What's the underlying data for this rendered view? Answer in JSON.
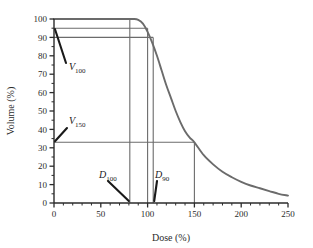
{
  "chart_data": {
    "type": "line",
    "title": "",
    "xlabel": "Dose (%)",
    "ylabel": "Volume (%)",
    "xlim": [
      0,
      250
    ],
    "ylim": [
      0,
      100
    ],
    "grid": false,
    "legend": null,
    "xticks": [
      0,
      50,
      100,
      150,
      200,
      250
    ],
    "xtick_labels": [
      "0",
      "50",
      "100",
      "150",
      "200",
      "250"
    ],
    "x_minor_tick_step": 10,
    "yticks": [
      0,
      10,
      20,
      30,
      40,
      50,
      60,
      70,
      80,
      90,
      100
    ],
    "ytick_labels": [
      "0",
      "10",
      "20",
      "30",
      "40",
      "50",
      "60",
      "70",
      "80",
      "90",
      "100"
    ],
    "series": [
      {
        "name": "dose-volume-histogram",
        "color": "#6b6b6b",
        "x": [
          0,
          10,
          20,
          30,
          40,
          50,
          60,
          70,
          80,
          85,
          90,
          95,
          100,
          105,
          110,
          115,
          120,
          125,
          130,
          135,
          140,
          145,
          150,
          160,
          170,
          180,
          190,
          200,
          210,
          220,
          230,
          240,
          250
        ],
        "y": [
          100,
          100,
          100,
          100,
          100,
          100,
          100,
          100,
          100,
          100,
          99.5,
          97.5,
          93,
          87,
          80,
          72,
          64,
          57,
          50,
          44,
          39,
          35.5,
          33,
          26,
          21,
          17,
          14,
          11.5,
          9.5,
          8,
          6.5,
          5,
          4
        ]
      }
    ],
    "reference_lines": {
      "horizontal": [
        {
          "name": "v-max-line",
          "value": 100,
          "x_from": 0,
          "x_to": 81,
          "color": "#6b6b6b"
        },
        {
          "name": "v100-line",
          "value": 95,
          "x_from": 0,
          "x_to": 100,
          "color": "#6b6b6b"
        },
        {
          "name": "v90-line",
          "value": 90,
          "x_from": 0,
          "x_to": 106,
          "color": "#6b6b6b"
        },
        {
          "name": "v150-line",
          "value": 33,
          "x_from": 0,
          "x_to": 150,
          "color": "#6b6b6b"
        }
      ],
      "vertical": [
        {
          "name": "d100-line",
          "value": 81,
          "y_from": 0,
          "y_to": 100,
          "color": "#6b6b6b"
        },
        {
          "name": "d-ref-line",
          "value": 100,
          "y_from": 0,
          "y_to": 95,
          "color": "#6b6b6b"
        },
        {
          "name": "d90-line",
          "value": 106,
          "y_from": 0,
          "y_to": 90,
          "color": "#6b6b6b"
        },
        {
          "name": "d150-line",
          "value": 150,
          "y_from": 0,
          "y_to": 33,
          "color": "#6b6b6b"
        }
      ]
    },
    "annotations": [
      {
        "name": "v100",
        "base": "V",
        "sub": "100",
        "points_to": {
          "x": 0,
          "y": 95
        }
      },
      {
        "name": "v150",
        "base": "V",
        "sub": "150",
        "points_to": {
          "x": 0,
          "y": 33
        }
      },
      {
        "name": "d100",
        "base": "D",
        "sub": "100",
        "points_to": {
          "x": 81,
          "y": 0
        }
      },
      {
        "name": "d90",
        "base": "D",
        "sub": "90",
        "points_to": {
          "x": 106,
          "y": 0
        }
      }
    ]
  },
  "axis": {
    "x_title": "Dose (%)",
    "y_title": "Volume (%)"
  },
  "ticks": {
    "x": [
      "0",
      "50",
      "100",
      "150",
      "200",
      "250"
    ],
    "y": [
      "0",
      "10",
      "20",
      "30",
      "40",
      "50",
      "60",
      "70",
      "80",
      "90",
      "100"
    ]
  },
  "labels": {
    "v100_base": "V",
    "v100_sub": "100",
    "v150_base": "V",
    "v150_sub": "150",
    "d100_base": "D",
    "d100_sub": "100",
    "d90_base": "D",
    "d90_sub": "90"
  },
  "colors": {
    "curve": "#6b6b6b",
    "reference_line": "#6b6b6b",
    "axis": "#2b2b2b",
    "annotation": "#1a1a1a",
    "background": "#ffffff"
  }
}
